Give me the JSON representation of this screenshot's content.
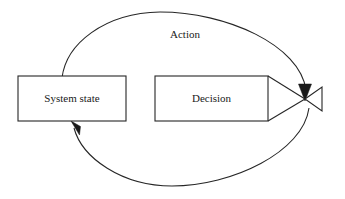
{
  "diagram": {
    "canvas": {
      "width": 345,
      "height": 199,
      "background": "#ffffff"
    },
    "stroke_color": "#262626",
    "text_color": "#1a1a1a",
    "nodes": [
      {
        "id": "system-state",
        "label": "System state",
        "shape": "rectangle",
        "x": 18,
        "y": 76,
        "width": 108,
        "height": 45,
        "center_x": 72,
        "center_y": 98.5
      },
      {
        "id": "decision",
        "label": "Decision",
        "shape": "rectangle",
        "x": 155,
        "y": 76,
        "width": 113,
        "height": 45,
        "center_x": 211.5,
        "center_y": 98.5
      }
    ],
    "edges": [
      {
        "id": "action-loop",
        "label": "Action",
        "shape": "ellipse",
        "label_x": 185,
        "label_y": 35,
        "center_x": 185,
        "center_y": 99,
        "radius_x": 126,
        "radius_y": 87,
        "arrow_top": "down-at-junction",
        "arrow_bottom": "up-left-into-system-state"
      }
    ],
    "junction": {
      "id": "bowtie-junction",
      "x": 305,
      "y": 99,
      "description": "converging valve / bowtie symbol",
      "wing_right_x": 322,
      "wing_top_y": 87,
      "wing_bottom_y": 111
    }
  }
}
